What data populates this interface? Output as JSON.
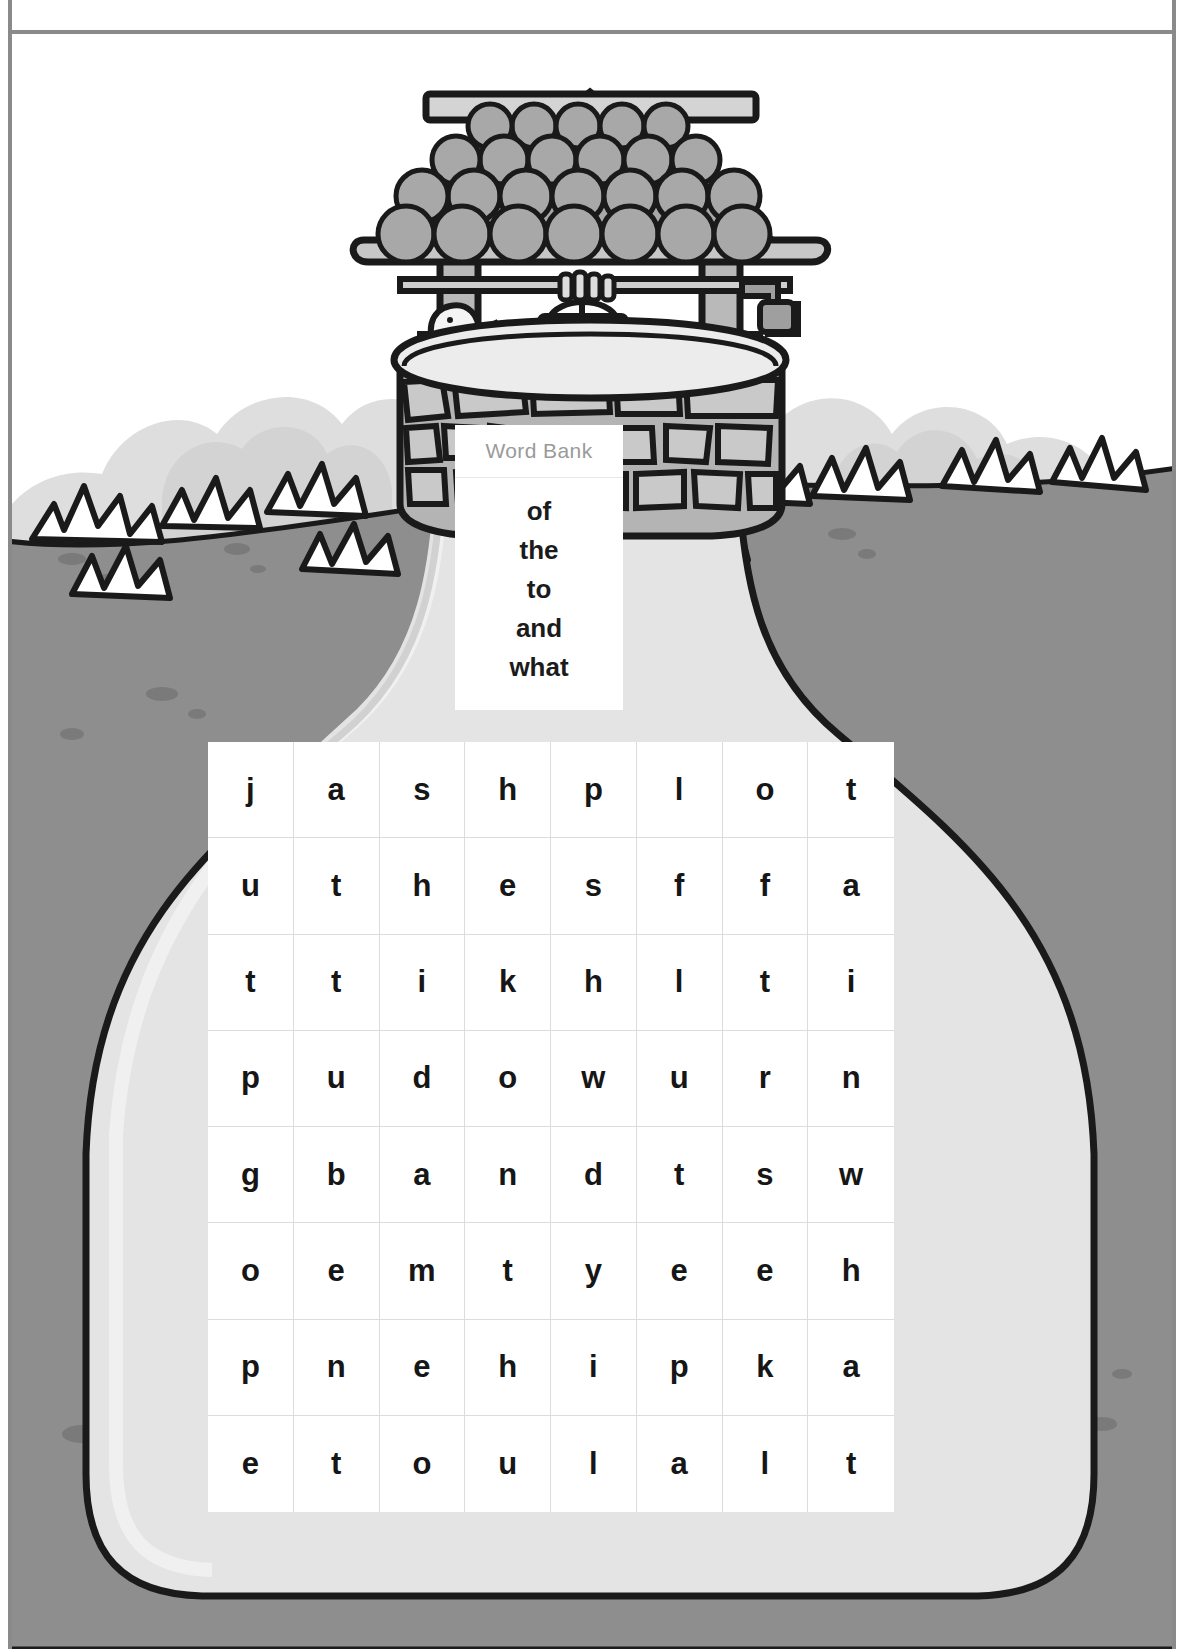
{
  "page": {
    "border_color": "#8a8a8a"
  },
  "illustration": {
    "name": "wishing-well-scene",
    "items": [
      {
        "name": "well-roof",
        "label": "shingled roof"
      },
      {
        "name": "well-crank",
        "label": "crank handle"
      },
      {
        "name": "well-bucket",
        "label": "bucket"
      },
      {
        "name": "bird",
        "label": "bird on well rim"
      },
      {
        "name": "well-stone-base",
        "label": "stone base"
      },
      {
        "name": "bushes",
        "label": "background bushes"
      },
      {
        "name": "grass-tufts",
        "label": "grass tufts on horizon"
      },
      {
        "name": "ground",
        "label": "gray ground with pebbles"
      },
      {
        "name": "path",
        "label": "light path widening downward"
      }
    ],
    "colors": {
      "roof": "#a8a8a8",
      "outline": "#1a1a1a",
      "ground": "#8e8e8e",
      "path": "#e2e2e2",
      "bush": "#dcdcdc",
      "stone": "#b4b4b4"
    }
  },
  "word_bank": {
    "title": "Word Bank",
    "title_color": "#9a9a9a",
    "words": [
      "of",
      "the",
      "to",
      "and",
      "what"
    ]
  },
  "puzzle": {
    "rows": 8,
    "columns": 8,
    "grid": [
      [
        "j",
        "a",
        "s",
        "h",
        "p",
        "l",
        "o",
        "t"
      ],
      [
        "u",
        "t",
        "h",
        "e",
        "s",
        "f",
        "f",
        "a"
      ],
      [
        "t",
        "t",
        "i",
        "k",
        "h",
        "l",
        "t",
        "i"
      ],
      [
        "p",
        "u",
        "d",
        "o",
        "w",
        "u",
        "r",
        "n"
      ],
      [
        "g",
        "b",
        "a",
        "n",
        "d",
        "t",
        "s",
        "w"
      ],
      [
        "o",
        "e",
        "m",
        "t",
        "y",
        "e",
        "e",
        "h"
      ],
      [
        "p",
        "n",
        "e",
        "h",
        "i",
        "p",
        "k",
        "a"
      ],
      [
        "e",
        "t",
        "o",
        "u",
        "l",
        "a",
        "l",
        "t"
      ]
    ]
  }
}
